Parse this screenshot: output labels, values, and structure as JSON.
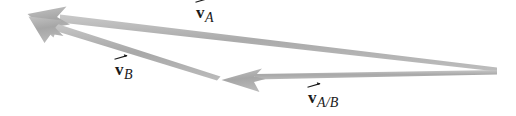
{
  "figure": {
    "type": "vector-diagram",
    "background_color": "#ffffff",
    "arrow_color": "#a9a9a9",
    "arrow_color_light": "#c4c4c4",
    "label_color": "#1a1a1a",
    "width": 516,
    "height": 116
  },
  "labels": {
    "v_a": {
      "symbol": "v",
      "subscript": "A",
      "full": "vA"
    },
    "v_b": {
      "symbol": "v",
      "subscript": "B",
      "full": "vB"
    },
    "v_ab": {
      "symbol": "v",
      "subscript": "A/B",
      "full": "vA/B"
    }
  },
  "vectors": [
    {
      "name": "v_a",
      "label": "vA",
      "tail": {
        "x": 496,
        "y": 69
      },
      "head": {
        "x": 28,
        "y": 15
      },
      "arrowhead": "at-head",
      "color": "#a9a9a9"
    },
    {
      "name": "v_b",
      "label": "vB",
      "tail": {
        "x": 219,
        "y": 79
      },
      "head": {
        "x": 29,
        "y": 18
      },
      "arrowhead": "at-head",
      "color": "#a9a9a9"
    },
    {
      "name": "v_ab",
      "label": "vA/B",
      "tail": {
        "x": 496,
        "y": 72
      },
      "head": {
        "x": 222,
        "y": 80
      },
      "arrowhead": "at-head",
      "color": "#a9a9a9"
    }
  ]
}
